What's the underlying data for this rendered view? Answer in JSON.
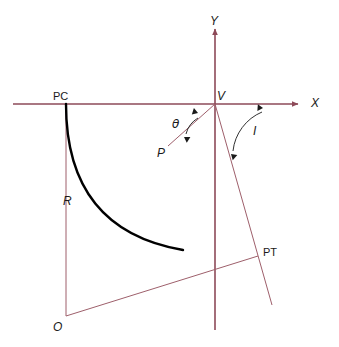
{
  "figure": {
    "kind": "geometry-diagram",
    "background_color": "#ffffff"
  },
  "colors": {
    "axis": "#8d4a58",
    "construction": "#9e5f6b",
    "curve": "#000000",
    "arc": "#1a1a1a",
    "label": "#1a1a1a"
  },
  "axes": {
    "x_axis": {
      "label": "X",
      "label_x": 311,
      "label_y": 107,
      "x1": 13,
      "y1": 104,
      "x2": 298,
      "y2": 104,
      "arrow": "right"
    },
    "y_axis": {
      "label": "Y",
      "label_x": 210,
      "label_y": 25,
      "x1": 215,
      "y1": 330,
      "x2": 215,
      "y2": 29,
      "arrow": "up"
    }
  },
  "points": [
    {
      "name": "PC",
      "label": "PC",
      "x": 66,
      "y": 104,
      "label_x": 53,
      "label_y": 100,
      "style": "upright"
    },
    {
      "name": "V",
      "label": "V",
      "x": 215,
      "y": 104,
      "label_x": 217,
      "label_y": 100,
      "style": "italic"
    },
    {
      "name": "P",
      "label": "P",
      "x": 172,
      "y": 140,
      "label_x": 157,
      "label_y": 157,
      "style": "italic"
    },
    {
      "name": "PT",
      "label": "PT",
      "x": 258,
      "y": 256,
      "label_x": 263,
      "label_y": 256,
      "style": "upright"
    },
    {
      "name": "O",
      "label": "O",
      "x": 66,
      "y": 316,
      "label_x": 53,
      "label_y": 331,
      "style": "italic"
    }
  ],
  "measures": [
    {
      "name": "R",
      "label": "R",
      "label_x": 63,
      "label_y": 205,
      "style": "italic",
      "description": "radius, PC to O"
    },
    {
      "name": "theta",
      "label": "θ",
      "label_x": 172,
      "label_y": 128,
      "style": "greek",
      "description": "deflection angle at V to point P"
    },
    {
      "name": "I",
      "label": "I",
      "label_x": 253,
      "label_y": 135,
      "style": "italic",
      "description": "intersection angle at V to PT"
    }
  ],
  "construction_lines": [
    {
      "name": "radius-pc-o",
      "x1": 66,
      "y1": 104,
      "x2": 66,
      "y2": 316
    },
    {
      "name": "radius-o-pt",
      "x1": 66,
      "y1": 316,
      "x2": 258,
      "y2": 256
    },
    {
      "name": "chord-v-p",
      "x1": 215,
      "y1": 104,
      "x2": 168,
      "y2": 146
    },
    {
      "name": "tangent-v-pt",
      "x1": 215,
      "y1": 104,
      "x2": 272,
      "y2": 305
    }
  ],
  "curve": {
    "name": "circular-curve",
    "from": "PC",
    "to": "PT",
    "path": "M 66,104 Q 66,230 183,250",
    "description": "circular arc from PC tangent to X axis, through P, ending at PT"
  },
  "angle_arcs": [
    {
      "name": "theta-arc",
      "path": "M 198,118 A 26,26 0 0 0 186,134",
      "arrow_start": {
        "x": 198,
        "y": 113,
        "angle": -72
      },
      "arrow_end": {
        "x": 184,
        "y": 137,
        "angle": 122
      }
    },
    {
      "name": "I-arc",
      "path": "M 262,112 A 48,48 0 0 0 233,151",
      "arrow_start": {
        "x": 263,
        "y": 108,
        "angle": -86
      },
      "arrow_end": {
        "x": 231,
        "y": 154,
        "angle": 132
      }
    }
  ]
}
